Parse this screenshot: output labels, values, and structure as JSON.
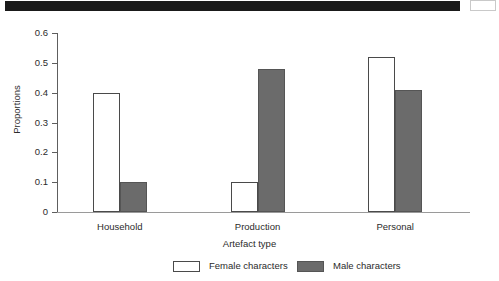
{
  "top_band": {
    "name": "redaction-band",
    "color": "#1a1a1a"
  },
  "chart_data": {
    "type": "bar",
    "title": "",
    "subtitle": "",
    "xlabel": "Artefact type",
    "ylabel": "Proportions",
    "categories": [
      "Household",
      "Production",
      "Personal"
    ],
    "series": [
      {
        "name": "Female characters",
        "values": [
          0.4,
          0.1,
          0.52
        ],
        "color": "#ffffff",
        "edge_color": "#4a4a4a"
      },
      {
        "name": "Male characters",
        "values": [
          0.1,
          0.48,
          0.41
        ],
        "color": "#6b6b6b",
        "edge_color": "#555555"
      }
    ],
    "ylim": [
      0,
      0.6
    ],
    "yticks": [
      0,
      0.1,
      0.2,
      0.3,
      0.4,
      0.5,
      0.6
    ],
    "ytick_labels": [
      "0",
      "0.1",
      "0.2",
      "0.3",
      "0.4",
      "0.5",
      "0.6"
    ],
    "grid": false,
    "legend_position": "bottom",
    "legend_entries": [
      "Female characters",
      "Male characters"
    ]
  }
}
